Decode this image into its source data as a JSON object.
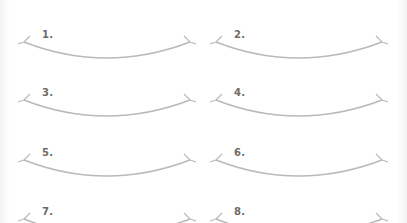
{
  "worksheet": {
    "items": [
      {
        "label": "1."
      },
      {
        "label": "2."
      },
      {
        "label": "3."
      },
      {
        "label": "4."
      },
      {
        "label": "5."
      },
      {
        "label": "6."
      },
      {
        "label": "7."
      },
      {
        "label": "8."
      }
    ],
    "curve_icon": "smile-arc-with-corner-ticks",
    "colors": {
      "curve": "#b9b9b9",
      "label": "#6b6b6b",
      "background": "#ffffff"
    }
  }
}
